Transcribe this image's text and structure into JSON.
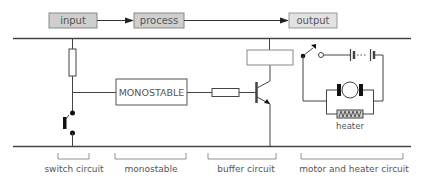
{
  "flow": {
    "blocks": [
      {
        "label": "input"
      },
      {
        "label": "process"
      },
      {
        "label": "output"
      }
    ]
  },
  "circuit": {
    "monostable_label": "MONOSTABLE",
    "heater_label": "heater"
  },
  "sections": [
    {
      "label": "switch circuit"
    },
    {
      "label": "monostable"
    },
    {
      "label": "buffer circuit"
    },
    {
      "label": "motor and heater circuit"
    }
  ],
  "colors": {
    "block_fill": "#cfcfcf",
    "line": "#444444",
    "text": "#555555"
  }
}
